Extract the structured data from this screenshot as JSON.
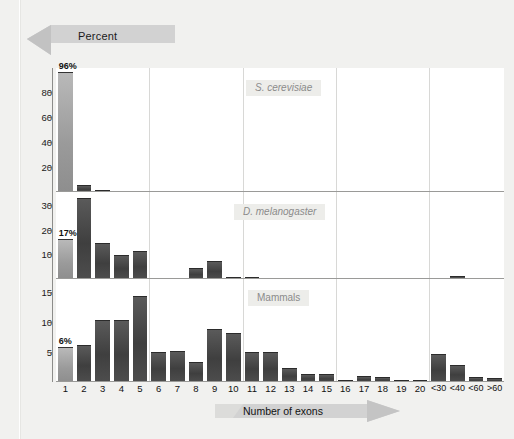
{
  "axis_titles": {
    "y": "Percent",
    "x": "Number of exons"
  },
  "panels": [
    {
      "caption": "S. cerevisiae",
      "yticks": [
        "20",
        "40",
        "60",
        "80"
      ],
      "first_bar_label": "96%"
    },
    {
      "caption": "D. melanogaster",
      "yticks": [
        "10",
        "20",
        "30"
      ],
      "first_bar_label": "17%"
    },
    {
      "caption": "Mammals",
      "yticks": [
        "5",
        "10",
        "15"
      ],
      "first_bar_label": "6%"
    }
  ],
  "chart_data": {
    "type": "bar",
    "xlabel": "Number of exons",
    "ylabel": "Percent",
    "grid": "vertical gridlines every 5 categories",
    "legend": "none",
    "categories": [
      "1",
      "2",
      "3",
      "4",
      "5",
      "6",
      "7",
      "8",
      "9",
      "10",
      "11",
      "12",
      "13",
      "14",
      "15",
      "16",
      "17",
      "18",
      "19",
      "20",
      "<30",
      "<40",
      "<60",
      ">60"
    ],
    "panels": [
      {
        "name": "S. cerevisiae",
        "ylim": [
          0,
          96
        ],
        "yticks": [
          20,
          40,
          60,
          80
        ],
        "highlight_index": 0,
        "highlight_label": "96%",
        "values": [
          96,
          6,
          1.2,
          0,
          0,
          0,
          0,
          0,
          0,
          0,
          0,
          0,
          0,
          0,
          0,
          0,
          0,
          0,
          0,
          0,
          0,
          0,
          0,
          0
        ]
      },
      {
        "name": "D. melanogaster",
        "ylim": [
          0,
          35
        ],
        "yticks": [
          10,
          20,
          30
        ],
        "highlight_index": 0,
        "highlight_label": "17%",
        "values": [
          17,
          34,
          15,
          10,
          12,
          0,
          0,
          4.5,
          7.5,
          0.6,
          0.8,
          0,
          0,
          0,
          0,
          0,
          0,
          0,
          0,
          0,
          0,
          1.2,
          0,
          0
        ]
      },
      {
        "name": "Mammals",
        "ylim": [
          0,
          17
        ],
        "yticks": [
          5,
          10,
          15
        ],
        "highlight_index": 0,
        "highlight_label": "6%",
        "values": [
          6,
          6.4,
          10.7,
          10.6,
          14.7,
          5.1,
          5.4,
          3.5,
          9.1,
          8.5,
          5.2,
          5.1,
          2.4,
          1.4,
          1.3,
          0.2,
          1.0,
          0.9,
          0.3,
          0.2,
          4.8,
          3.0,
          0.8,
          0.7
        ]
      }
    ]
  }
}
